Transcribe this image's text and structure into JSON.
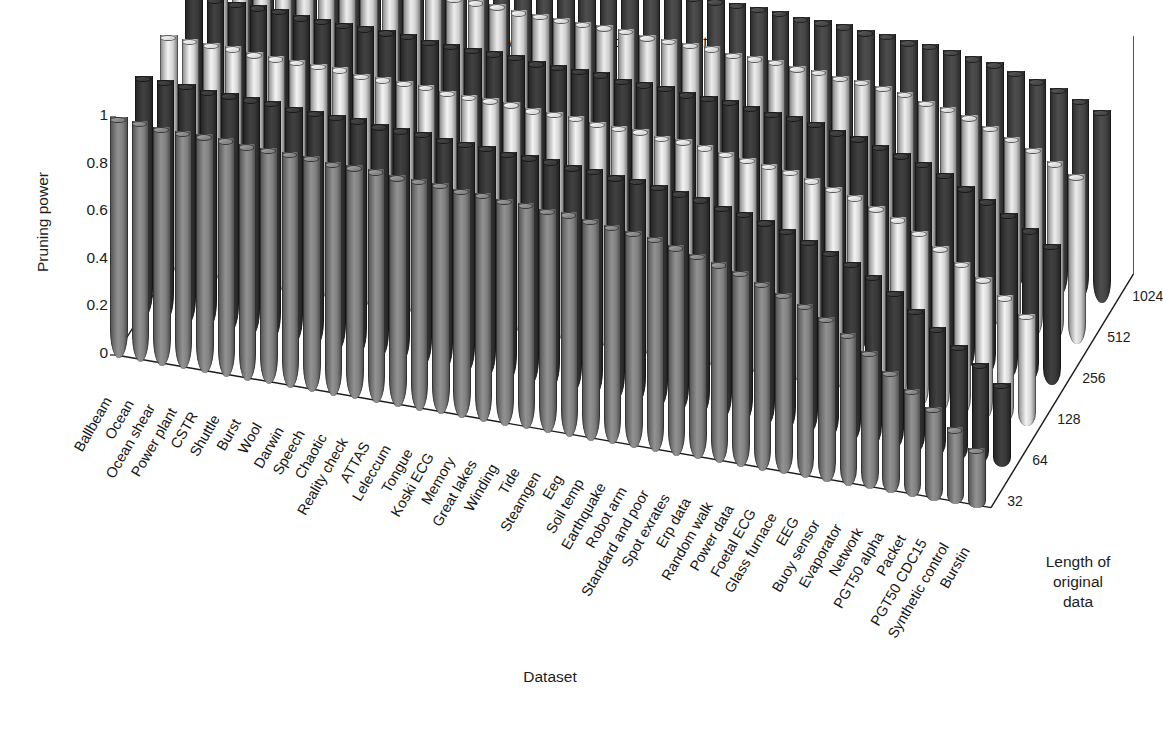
{
  "chart_data": {
    "type": "bar",
    "subtype": "3d-cylinder-grouped",
    "title": "Pruning power vs. Length of original data",
    "xlabel": "Dataset",
    "ylabel": "Pruning power",
    "zlabel": "Length of\noriginal\ndata",
    "zlabel_lines": [
      "Length of",
      "original",
      "data"
    ],
    "ylim": [
      0,
      1
    ],
    "yticks": [
      "0",
      "0.2",
      "0.4",
      "0.6",
      "0.8",
      "1"
    ],
    "ytick_values": [
      0,
      0.2,
      0.4,
      0.6,
      0.8,
      1
    ],
    "grid": false,
    "legend_position": "depth-axis-right",
    "zticks": [
      "1024",
      "512",
      "256",
      "128",
      "64",
      "32"
    ],
    "categories": [
      "Ballbeam",
      "Ocean",
      "Ocean shear",
      "Power plant",
      "CSTR",
      "Shuttle",
      "Burst",
      "Wool",
      "Darwin",
      "Speech",
      "Chaotic",
      "Reality check",
      "ATTAS",
      "Leleccum",
      "Tongue",
      "Koski ECG",
      "Memory",
      "Great lakes",
      "Winding",
      "Tide",
      "Steamgen",
      "Eeg",
      "Soil temp",
      "Earthquake",
      "Robot arm",
      "Standard and poor",
      "Spot exrates",
      "Erp data",
      "Random walk",
      "Power data",
      "Foetal ECG",
      "Glass furnace",
      "EEG",
      "Buoy sensor",
      "Evaporator",
      "Network",
      "PGT50 alpha",
      "Packet",
      "PGT50 CDC15",
      "Synthetic control",
      "Burstin"
    ],
    "series": [
      {
        "name": "32",
        "depth_index": 0,
        "shade": "#8a8a8a",
        "values": [
          1.0,
          1.0,
          0.99,
          0.99,
          0.99,
          0.99,
          0.98,
          0.98,
          0.98,
          0.98,
          0.97,
          0.97,
          0.97,
          0.96,
          0.96,
          0.96,
          0.95,
          0.95,
          0.94,
          0.94,
          0.93,
          0.93,
          0.92,
          0.91,
          0.9,
          0.89,
          0.87,
          0.85,
          0.83,
          0.81,
          0.78,
          0.75,
          0.72,
          0.68,
          0.63,
          0.57,
          0.5,
          0.44,
          0.38,
          0.31,
          0.24
        ]
      },
      {
        "name": "64",
        "depth_index": 1,
        "shade": "#3d3d3d",
        "values": [
          1.0,
          1.0,
          1.0,
          0.99,
          0.99,
          0.99,
          0.99,
          0.98,
          0.98,
          0.98,
          0.98,
          0.97,
          0.97,
          0.97,
          0.96,
          0.96,
          0.96,
          0.95,
          0.95,
          0.95,
          0.94,
          0.94,
          0.93,
          0.93,
          0.92,
          0.91,
          0.9,
          0.88,
          0.87,
          0.85,
          0.83,
          0.8,
          0.77,
          0.74,
          0.7,
          0.65,
          0.59,
          0.53,
          0.47,
          0.41,
          0.34
        ]
      },
      {
        "name": "128",
        "depth_index": 2,
        "shade": "#e6e6e6",
        "values": [
          1.0,
          1.0,
          1.0,
          1.0,
          0.99,
          0.99,
          0.99,
          0.99,
          0.99,
          0.98,
          0.98,
          0.98,
          0.98,
          0.97,
          0.97,
          0.97,
          0.97,
          0.96,
          0.96,
          0.96,
          0.95,
          0.95,
          0.95,
          0.94,
          0.94,
          0.93,
          0.92,
          0.91,
          0.9,
          0.89,
          0.87,
          0.85,
          0.83,
          0.8,
          0.77,
          0.73,
          0.68,
          0.63,
          0.58,
          0.52,
          0.46
        ]
      },
      {
        "name": "256",
        "depth_index": 3,
        "shade": "#3d3d3d",
        "values": [
          1.0,
          1.0,
          1.0,
          1.0,
          1.0,
          0.99,
          0.99,
          0.99,
          0.99,
          0.99,
          0.99,
          0.98,
          0.98,
          0.98,
          0.98,
          0.98,
          0.97,
          0.97,
          0.97,
          0.97,
          0.96,
          0.96,
          0.96,
          0.95,
          0.95,
          0.95,
          0.94,
          0.93,
          0.93,
          0.92,
          0.9,
          0.89,
          0.87,
          0.85,
          0.83,
          0.8,
          0.76,
          0.72,
          0.68,
          0.63,
          0.58
        ]
      },
      {
        "name": "512",
        "depth_index": 4,
        "shade": "#e0e0e0",
        "values": [
          1.0,
          1.0,
          1.0,
          1.0,
          1.0,
          1.0,
          1.0,
          0.99,
          0.99,
          0.99,
          0.99,
          0.99,
          0.99,
          0.99,
          0.98,
          0.98,
          0.98,
          0.98,
          0.98,
          0.98,
          0.97,
          0.97,
          0.97,
          0.97,
          0.96,
          0.96,
          0.96,
          0.95,
          0.95,
          0.94,
          0.94,
          0.93,
          0.92,
          0.9,
          0.89,
          0.87,
          0.84,
          0.81,
          0.78,
          0.74,
          0.7
        ]
      },
      {
        "name": "1024",
        "depth_index": 5,
        "shade": "#4a4a4a",
        "values": [
          1.0,
          1.0,
          1.0,
          1.0,
          1.0,
          1.0,
          1.0,
          1.0,
          1.0,
          1.0,
          0.99,
          0.99,
          0.99,
          0.99,
          0.99,
          0.99,
          0.99,
          0.99,
          0.99,
          0.99,
          0.98,
          0.98,
          0.98,
          0.98,
          0.98,
          0.98,
          0.97,
          0.97,
          0.97,
          0.96,
          0.96,
          0.95,
          0.95,
          0.94,
          0.93,
          0.92,
          0.9,
          0.88,
          0.86,
          0.83,
          0.8
        ]
      }
    ]
  },
  "colors": {
    "axis": "#1a1a1a",
    "text": "#1d1d1d",
    "background": "#ffffff"
  }
}
